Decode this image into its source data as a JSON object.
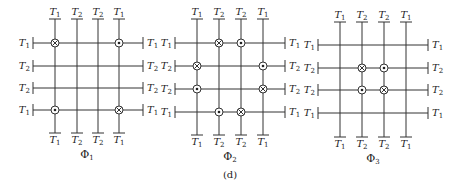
{
  "figure": {
    "caption": "(d)",
    "legend_symbols": {
      "cross": "circle-with-cross (current into page)",
      "dot": "circle-with-dot (current out of page)"
    },
    "panels": [
      {
        "id": "phi1",
        "label": "Φ",
        "label_sub": "1",
        "x_cols": [
          55,
          77,
          98,
          119
        ],
        "y_rows": [
          43,
          66,
          88,
          110
        ],
        "x_left": 33,
        "x_right": 143,
        "y_top": 19,
        "y_bottom": 133,
        "top_labels": [
          [
            "T",
            "1"
          ],
          [
            "T",
            "2"
          ],
          [
            "T",
            "2"
          ],
          [
            "T",
            "1"
          ]
        ],
        "bottom_labels": [
          [
            "T",
            "1"
          ],
          [
            "T",
            "2"
          ],
          [
            "T",
            "2"
          ],
          [
            "T",
            "1"
          ]
        ],
        "left_labels": [
          [
            "T",
            "1"
          ],
          [
            "T",
            "2"
          ],
          [
            "T",
            "2"
          ],
          [
            "T",
            "1"
          ]
        ],
        "right_labels": [
          [
            "T",
            "1"
          ],
          [
            "T",
            "2"
          ],
          [
            "T",
            "2"
          ],
          [
            "T",
            "1"
          ]
        ],
        "markers": [
          {
            "row": 0,
            "col": 0,
            "type": "cross"
          },
          {
            "row": 0,
            "col": 3,
            "type": "dot"
          },
          {
            "row": 3,
            "col": 0,
            "type": "dot"
          },
          {
            "row": 3,
            "col": 3,
            "type": "cross"
          }
        ]
      },
      {
        "id": "phi2",
        "label": "Φ",
        "label_sub": "2",
        "x_cols": [
          197,
          219,
          241,
          263
        ],
        "y_rows": [
          43,
          66,
          89,
          112
        ],
        "x_left": 175,
        "x_right": 285,
        "y_top": 19,
        "y_bottom": 135,
        "top_labels": [
          [
            "T",
            "1"
          ],
          [
            "T",
            "2"
          ],
          [
            "T",
            "2"
          ],
          [
            "T",
            "1"
          ]
        ],
        "bottom_labels": [
          [
            "T",
            "1"
          ],
          [
            "T",
            "2"
          ],
          [
            "T",
            "2"
          ],
          [
            "T",
            "1"
          ]
        ],
        "left_labels": [
          [
            "T",
            "1"
          ],
          [
            "T",
            "2"
          ],
          [
            "T",
            "2"
          ],
          [
            "T",
            "1"
          ]
        ],
        "right_labels": [
          [
            "T",
            "1"
          ],
          [
            "T",
            "2"
          ],
          [
            "T",
            "2"
          ],
          [
            "T",
            "1"
          ]
        ],
        "markers": [
          {
            "row": 0,
            "col": 1,
            "type": "cross"
          },
          {
            "row": 0,
            "col": 2,
            "type": "dot"
          },
          {
            "row": 1,
            "col": 0,
            "type": "cross"
          },
          {
            "row": 1,
            "col": 3,
            "type": "dot"
          },
          {
            "row": 2,
            "col": 0,
            "type": "dot"
          },
          {
            "row": 2,
            "col": 3,
            "type": "cross"
          },
          {
            "row": 3,
            "col": 1,
            "type": "dot"
          },
          {
            "row": 3,
            "col": 2,
            "type": "cross"
          }
        ]
      },
      {
        "id": "phi3",
        "label": "Φ",
        "label_sub": "3",
        "x_cols": [
          340,
          362,
          384,
          406
        ],
        "y_rows": [
          45,
          68,
          90,
          113
        ],
        "x_left": 318,
        "x_right": 428,
        "y_top": 22,
        "y_bottom": 137,
        "top_labels": [
          [
            "T",
            "1"
          ],
          [
            "T",
            "2"
          ],
          [
            "T",
            "2"
          ],
          [
            "T",
            "1"
          ]
        ],
        "bottom_labels": [
          [
            "T",
            "1"
          ],
          [
            "T",
            "2"
          ],
          [
            "T",
            "2"
          ],
          [
            "T",
            "1"
          ]
        ],
        "left_labels": [
          [
            "T",
            "1"
          ],
          [
            "T",
            "2"
          ],
          [
            "T",
            "2"
          ],
          [
            "T",
            "1"
          ]
        ],
        "right_labels": [
          [
            "T",
            "1"
          ],
          [
            "T",
            "2"
          ],
          [
            "T",
            "2"
          ],
          [
            "T",
            "1"
          ]
        ],
        "markers": [
          {
            "row": 1,
            "col": 1,
            "type": "cross"
          },
          {
            "row": 1,
            "col": 2,
            "type": "dot"
          },
          {
            "row": 2,
            "col": 1,
            "type": "dot"
          },
          {
            "row": 2,
            "col": 2,
            "type": "cross"
          }
        ]
      }
    ]
  }
}
